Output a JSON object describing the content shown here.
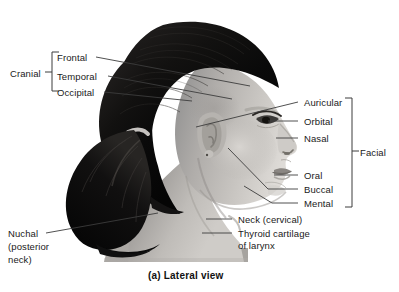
{
  "figure": {
    "caption": "(a) Lateral view",
    "caption_pos": {
      "x": 148,
      "y": 270
    },
    "width": 399,
    "height": 292,
    "background": "#ffffff",
    "leader_color": "#3c3c3c",
    "bracket_color": "#3c3c3c",
    "text_color": "#1a1a1a",
    "subject_description": "Lateral (side) photograph of a young woman's head and neck with hair pulled back into a ponytail"
  },
  "groups": [
    {
      "name": "cranial",
      "label": "Cranial",
      "label_pos": {
        "x": 10,
        "y": 68
      },
      "bracket": {
        "x": 52,
        "y_top": 52,
        "y_bottom": 91,
        "tick_y": 72,
        "side": "right"
      }
    },
    {
      "name": "facial",
      "label": "Facial",
      "label_pos": {
        "x": 360,
        "y": 147
      },
      "bracket": {
        "x": 352,
        "y_top": 98,
        "y_bottom": 207,
        "tick_y": 151,
        "side": "left"
      }
    }
  ],
  "labels": [
    {
      "name": "frontal",
      "text": "Frontal",
      "pos": {
        "x": 57,
        "y": 52
      },
      "leader": {
        "x1": 96,
        "y1": 57,
        "x2": 250,
        "y2": 86
      }
    },
    {
      "name": "temporal",
      "text": "Temporal",
      "pos": {
        "x": 57,
        "y": 71
      },
      "leader": {
        "x1": 108,
        "y1": 76,
        "x2": 232,
        "y2": 99
      }
    },
    {
      "name": "occipital",
      "text": "Occipital",
      "pos": {
        "x": 57,
        "y": 87
      },
      "leader": {
        "x1": 104,
        "y1": 92,
        "x2": 192,
        "y2": 101
      }
    },
    {
      "name": "auricular",
      "text": "Auricular",
      "pos": {
        "x": 304,
        "y": 97
      },
      "leader": {
        "x1": 298,
        "y1": 102,
        "x2": 196,
        "y2": 127
      }
    },
    {
      "name": "orbital",
      "text": "Orbital",
      "pos": {
        "x": 304,
        "y": 116
      },
      "leader": {
        "x1": 298,
        "y1": 121,
        "x2": 268,
        "y2": 121
      }
    },
    {
      "name": "nasal",
      "text": "Nasal",
      "pos": {
        "x": 304,
        "y": 133
      },
      "leader": {
        "x1": 298,
        "y1": 138,
        "x2": 276,
        "y2": 138
      }
    },
    {
      "name": "oral",
      "text": "Oral",
      "pos": {
        "x": 304,
        "y": 170
      },
      "leader": {
        "x1": 298,
        "y1": 175,
        "x2": 274,
        "y2": 175
      }
    },
    {
      "name": "buccal",
      "text": "Buccal",
      "pos": {
        "x": 304,
        "y": 184
      },
      "leader": {
        "x1": 298,
        "y1": 189,
        "x2": 268,
        "y2": 189
      }
    },
    {
      "name": "mental",
      "text": "Mental",
      "pos": {
        "x": 304,
        "y": 198
      },
      "leader": {
        "x1": 298,
        "y1": 203,
        "x2": 272,
        "y2": 203
      }
    },
    {
      "name": "neck-cervical",
      "text": "Neck (cervical)",
      "pos": {
        "x": 238,
        "y": 214
      },
      "leader": {
        "x1": 232,
        "y1": 219,
        "x2": 206,
        "y2": 219
      }
    },
    {
      "name": "thyroid-cartilage",
      "text": "Thyroid cartilage",
      "pos": {
        "x": 238,
        "y": 228
      },
      "leader": {
        "x1": 232,
        "y1": 233,
        "x2": 202,
        "y2": 233
      }
    },
    {
      "name": "thyroid-cartilage-line2",
      "text": "of larynx",
      "pos": {
        "x": 238,
        "y": 240
      },
      "leader": null
    },
    {
      "name": "nuchal",
      "text": "Nuchal",
      "pos": {
        "x": 8,
        "y": 228
      },
      "leader": {
        "x1": 46,
        "y1": 233,
        "x2": 158,
        "y2": 213
      }
    },
    {
      "name": "nuchal-posterior",
      "text": "(posterior",
      "pos": {
        "x": 8,
        "y": 241
      },
      "leader": null
    },
    {
      "name": "nuchal-neck",
      "text": "neck)",
      "pos": {
        "x": 8,
        "y": 254
      },
      "leader": null
    }
  ],
  "photo_leaders_internal": [
    {
      "name": "buccal-internal",
      "x1": 268,
      "y1": 189,
      "x2": 228,
      "y2": 148
    },
    {
      "name": "mental-internal",
      "x1": 272,
      "y1": 203,
      "x2": 244,
      "y2": 186
    }
  ]
}
